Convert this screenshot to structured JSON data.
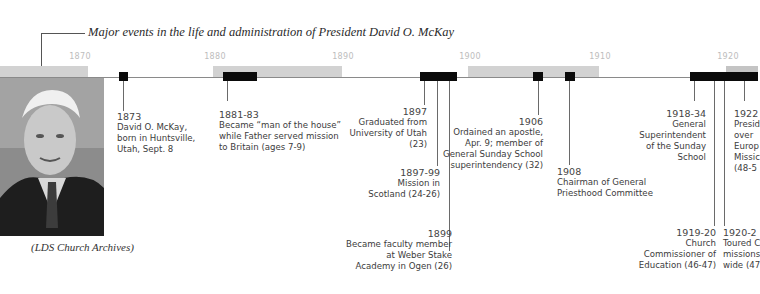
{
  "header": {
    "title": "Major events in the life and administration of President David O. McKay"
  },
  "timeline": {
    "year_labels": [
      {
        "label": "1870",
        "x": 80
      },
      {
        "label": "1880",
        "x": 215
      },
      {
        "label": "1890",
        "x": 343
      },
      {
        "label": "1900",
        "x": 470
      },
      {
        "label": "1910",
        "x": 600
      },
      {
        "label": "1920",
        "x": 728
      }
    ],
    "band_colors": {
      "gray": "#d2d2d2",
      "white": "#ffffff",
      "bar": "#0a0a0a"
    },
    "events": [
      {
        "year": "1873",
        "text": [
          "David O. McKay,",
          "born in Huntsville,",
          "Utah, Sept. 8"
        ]
      },
      {
        "year": "1881-83",
        "text": [
          "Became “man of the house”",
          "while Father served mission",
          "to Britain (ages 7-9)"
        ]
      },
      {
        "year": "1897",
        "text": [
          "Graduated from",
          "University of Utah",
          "(23)"
        ]
      },
      {
        "year": "1897-99",
        "text": [
          "Mission in",
          "Scotland (24-26)"
        ]
      },
      {
        "year": "1899",
        "text": [
          "Became faculty member",
          "at Weber Stake",
          "Academy in Ogen (26)"
        ]
      },
      {
        "year": "1906",
        "text": [
          "Ordained an apostle,",
          "Apr. 9; member of",
          "General Sunday School",
          "superintendency (32)"
        ]
      },
      {
        "year": "1908",
        "text": [
          "Chairman of General",
          "Priesthood Committee"
        ]
      },
      {
        "year": "1918-34",
        "text": [
          "General",
          "Superintendent",
          "of the Sunday",
          "School"
        ]
      },
      {
        "year": "1919-20",
        "text": [
          "Church",
          "Commissioner of",
          "Education (46-47)"
        ]
      },
      {
        "year": "1920-2",
        "text": [
          "Toured C",
          "missions",
          "wide (47"
        ]
      },
      {
        "year": "1922",
        "text": [
          "Presid",
          "over",
          "Europ",
          "Missic",
          "(48-5"
        ]
      }
    ]
  },
  "photo": {
    "caption": "(LDS Church Archives)"
  }
}
